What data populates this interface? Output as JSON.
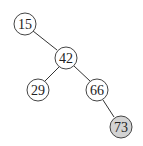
{
  "diagram": {
    "type": "binary-tree",
    "colors": {
      "default_fill": "#ffffff",
      "highlight_fill": "#d3d3d3",
      "stroke": "#444444"
    },
    "nodes": [
      {
        "id": "n15",
        "label": "15",
        "x": 25,
        "y": 24,
        "highlighted": false
      },
      {
        "id": "n42",
        "label": "42",
        "x": 66,
        "y": 58,
        "highlighted": false
      },
      {
        "id": "n29",
        "label": "29",
        "x": 38,
        "y": 90,
        "highlighted": false
      },
      {
        "id": "n66",
        "label": "66",
        "x": 97,
        "y": 90,
        "highlighted": false
      },
      {
        "id": "n73",
        "label": "73",
        "x": 121,
        "y": 127,
        "highlighted": true
      }
    ],
    "edges": [
      {
        "from": "15",
        "to": "42"
      },
      {
        "from": "42",
        "to": "29"
      },
      {
        "from": "42",
        "to": "66"
      },
      {
        "from": "66",
        "to": "73"
      }
    ]
  }
}
